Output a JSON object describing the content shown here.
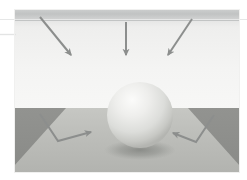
{
  "scene": {
    "title": "light-bounce-sphere-render",
    "canvas": {
      "width": 247,
      "height": 180
    },
    "image_frame": {
      "x": 14,
      "y": 9,
      "width": 226,
      "height": 164
    },
    "background_color": "#ffffff",
    "wall": {
      "name": "back-wall",
      "color_top": "#c9cbcb",
      "color_main": "#f2f2f1",
      "band_color": "#c2c4c4",
      "band_y": 9,
      "band_height": 11,
      "horizon_y": 108
    },
    "floor": {
      "name": "floor-plane",
      "color": "#b9bab6",
      "color_far": "#c3c4c0",
      "top_y": 108,
      "bottom_y": 173,
      "left_x": 14,
      "right_x": 240,
      "dark_corners_color": "#8d8e8b",
      "corner_left_points": "14,108 66,108 14,164",
      "corner_right_points": "240,108 188,108 240,164"
    },
    "sphere": {
      "name": "sphere",
      "center_x": 140,
      "center_y": 115,
      "radius": 33,
      "highlight_x": 128,
      "highlight_y": 98,
      "color_light": "#f4f4f3",
      "color_mid": "#d9dad8",
      "color_dark": "#b6b7b4",
      "shadow_color": "#8f918d",
      "shadow_cx": 140,
      "shadow_cy": 150,
      "shadow_rx": 34,
      "shadow_ry": 9
    },
    "arrow_color": "#8c8e8d",
    "incoming_rays": [
      {
        "name": "incoming-ray-left",
        "label": "incident light ray 1",
        "x1": 40,
        "y1": 17,
        "x2": 71,
        "y2": 55,
        "direction": "down-right"
      },
      {
        "name": "incoming-ray-center",
        "label": "incident light ray 2",
        "x1": 126,
        "y1": 22,
        "x2": 126,
        "y2": 55,
        "direction": "down"
      },
      {
        "name": "incoming-ray-right",
        "label": "incident light ray 3",
        "x1": 192,
        "y1": 19,
        "x2": 168,
        "y2": 55,
        "direction": "down-left"
      }
    ],
    "bounce_rays": [
      {
        "name": "bounce-ray-left",
        "label": "reflected bounce ray left",
        "path": "M 40,114 L 58,141 L 91,132",
        "tip": "91,132",
        "direction": "right"
      },
      {
        "name": "bounce-ray-right",
        "label": "reflected bounce ray right",
        "path": "M 214,115 L 196,142 L 173,133",
        "tip": "173,133",
        "direction": "left"
      }
    ]
  }
}
